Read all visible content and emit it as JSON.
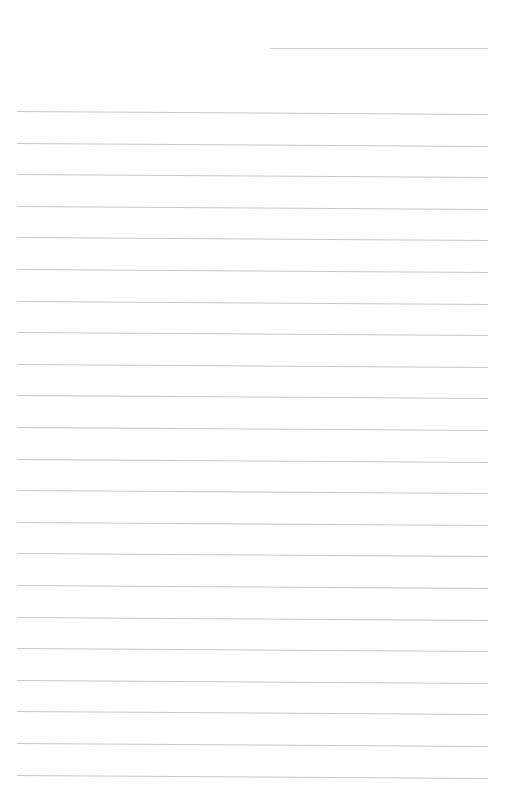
{
  "page": {
    "type": "lined-notebook-paper",
    "background_color": "#fefefe",
    "line_color": "#c9c9c9",
    "header_line": {
      "x1": 270,
      "x2": 488,
      "y": 48
    },
    "rules": {
      "x1": 17,
      "x2": 488,
      "first_y": 111,
      "spacing": 31.6,
      "count": 22,
      "tilt_deg": 0.35
    }
  }
}
